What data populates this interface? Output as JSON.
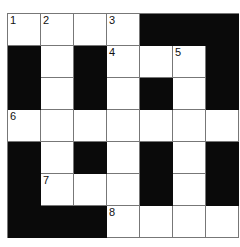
{
  "puzzle": {
    "rows": 7,
    "cols": 7,
    "grid": [
      [
        "W",
        "W",
        "W",
        "W",
        "B",
        "B",
        "B"
      ],
      [
        "B",
        "W",
        "B",
        "W",
        "W",
        "W",
        "B"
      ],
      [
        "B",
        "W",
        "B",
        "W",
        "B",
        "W",
        "B"
      ],
      [
        "W",
        "W",
        "W",
        "W",
        "W",
        "W",
        "W"
      ],
      [
        "B",
        "W",
        "B",
        "W",
        "B",
        "W",
        "B"
      ],
      [
        "B",
        "W",
        "W",
        "W",
        "B",
        "W",
        "B"
      ],
      [
        "B",
        "B",
        "B",
        "W",
        "W",
        "W",
        "W"
      ]
    ],
    "numbers": [
      {
        "row": 0,
        "col": 0,
        "label": "1"
      },
      {
        "row": 0,
        "col": 1,
        "label": "2"
      },
      {
        "row": 0,
        "col": 3,
        "label": "3"
      },
      {
        "row": 1,
        "col": 3,
        "label": "4"
      },
      {
        "row": 1,
        "col": 5,
        "label": "5"
      },
      {
        "row": 3,
        "col": 0,
        "label": "6"
      },
      {
        "row": 5,
        "col": 1,
        "label": "7"
      },
      {
        "row": 6,
        "col": 3,
        "label": "8"
      }
    ]
  },
  "colors": {
    "black_cell": "#0a0a0a",
    "white_cell": "#ffffff",
    "grid_line": "#777777"
  }
}
